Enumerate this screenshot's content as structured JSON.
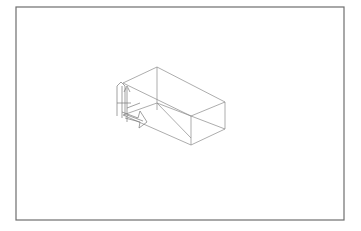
{
  "viewport": {
    "title": "",
    "background": "#ffffff",
    "frame_color": "#6e6e6e",
    "line_color": "#8a8a8a"
  },
  "drawing": {
    "frame": {
      "x": 16,
      "y": 7,
      "width": 328,
      "height": 213
    },
    "box": {
      "vertices": {
        "top_back": [
          157,
          67
        ],
        "top_left": [
          123,
          83
        ],
        "top_right": [
          225,
          102
        ],
        "top_front": [
          191,
          116
        ],
        "bottom_back": [
          157,
          103
        ],
        "bottom_left": [
          123,
          115
        ],
        "bottom_right": [
          225,
          129
        ],
        "bottom_front": [
          191,
          145
        ]
      },
      "diagonal": [
        [
          157,
          103
        ],
        [
          191,
          138
        ]
      ]
    },
    "axis_gizmo": {
      "labels": []
    }
  }
}
